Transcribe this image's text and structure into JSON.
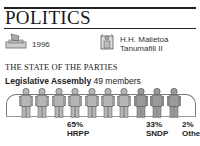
{
  "header": {
    "title": "POLITICS"
  },
  "info": {
    "election": {
      "icon": "ballot-box-icon",
      "year": "1996"
    },
    "head_of_state": {
      "icon": "head-of-state-icon",
      "line1": "H.H. Malietoa",
      "line2": "Tanumafili II"
    }
  },
  "section": {
    "title": "THE STATE OF THE PARTIES",
    "assembly_name": "Legislative Assembly",
    "assembly_members": "49 members"
  },
  "colors": {
    "hrpp": "#b5b5b5",
    "sndp": "#9a9a9a",
    "outline": "#555555"
  },
  "chart_data": {
    "type": "pictogram",
    "title": "Legislative Assembly 49 members",
    "categories": [
      "HRPP",
      "SNDP",
      "Other"
    ],
    "values": [
      65,
      33,
      2
    ],
    "unit": "%",
    "figures_total": 10,
    "figures": [
      7,
      3,
      0
    ]
  },
  "labels": [
    {
      "pct": "65%",
      "name": "HRPP"
    },
    {
      "pct": "33%",
      "name": "SNDP"
    },
    {
      "pct": "2%",
      "name": "Other"
    }
  ]
}
